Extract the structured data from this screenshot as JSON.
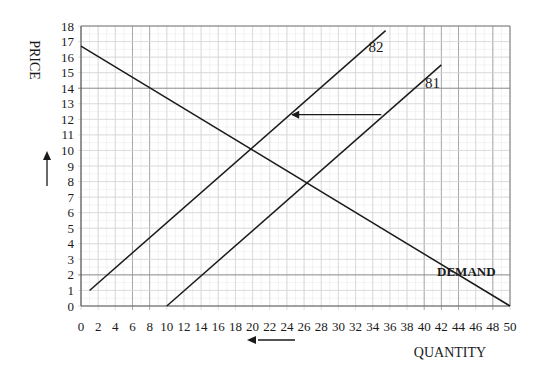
{
  "chart_data": {
    "type": "line",
    "title": "",
    "xlabel": "QUANTITY",
    "ylabel": "PRICE",
    "xlim": [
      0,
      50
    ],
    "ylim": [
      0,
      18
    ],
    "x_ticks": [
      0,
      2,
      4,
      6,
      8,
      10,
      12,
      14,
      16,
      18,
      20,
      22,
      24,
      26,
      28,
      30,
      32,
      34,
      36,
      38,
      40,
      42,
      44,
      46,
      48,
      50
    ],
    "y_ticks": [
      0,
      1,
      2,
      3,
      4,
      5,
      6,
      7,
      8,
      9,
      10,
      11,
      12,
      13,
      14,
      15,
      16,
      17,
      18
    ],
    "grid": true,
    "series": [
      {
        "name": "DEMAND",
        "points": [
          [
            0,
            16.7
          ],
          [
            50,
            0
          ]
        ]
      },
      {
        "name": "S2",
        "display_label": "82",
        "points": [
          [
            1,
            1
          ],
          [
            35.5,
            17.7
          ]
        ]
      },
      {
        "name": "S1",
        "display_label": "81",
        "points": [
          [
            10,
            0
          ],
          [
            42,
            15.5
          ]
        ]
      }
    ],
    "annotations": [
      {
        "type": "arrow",
        "description": "supply shift left",
        "from": [
          35,
          12.3
        ],
        "to": [
          24.5,
          12.3
        ]
      },
      {
        "type": "arrow",
        "description": "price up indicator",
        "position": "left of y-axis"
      },
      {
        "type": "arrow",
        "description": "quantity down indicator",
        "position": "below x-axis"
      }
    ],
    "labels": {
      "demand": "DEMAND",
      "s2": "82",
      "s1": "81"
    }
  }
}
